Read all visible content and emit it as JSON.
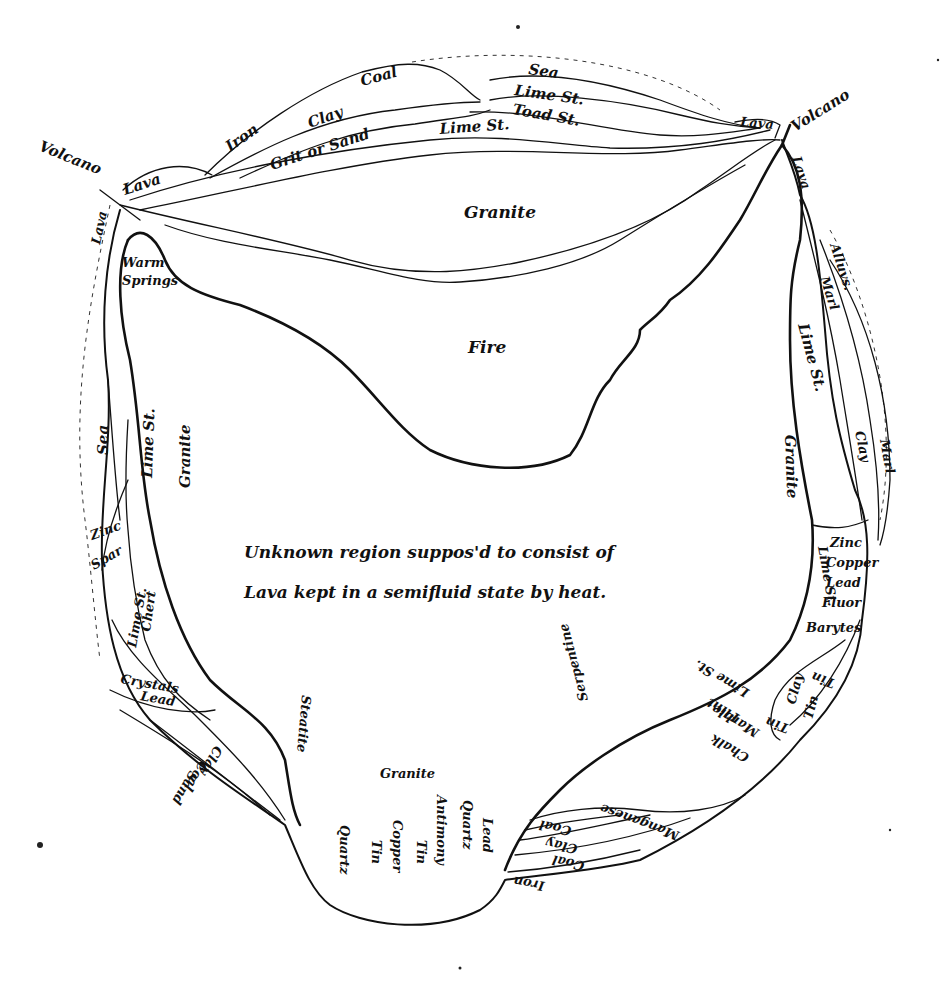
{
  "diagram": {
    "center_text": {
      "line1": "Unknown region suppos'd to consist of",
      "line2": "Lava kept in a semifluid state by heat."
    },
    "regions": {
      "upper_granite": "Granite",
      "fire": "Fire",
      "warm_springs_line1": "Warm",
      "warm_springs_line2": "Springs",
      "bottom_granite": "Granite"
    },
    "volcanoes": {
      "left": "Volcano",
      "right": "Volcano"
    },
    "top_strata": {
      "sea": "Sea",
      "lime_st_1": "Lime St.",
      "toad_st": "Toad St.",
      "lime_st_2": "Lime St.",
      "coal": "Coal",
      "clay": "Clay",
      "iron": "Iron",
      "grit_or_sand": "Grit or Sand",
      "lava_left": "Lava",
      "lava_right": "Lava"
    },
    "left_strata": {
      "lava": "Lava",
      "sea": "Sea",
      "lime_st": "Lime St.",
      "granite": "Granite",
      "zinc": "Zinc",
      "spar": "Spar",
      "lime_st_2": "Lime St.",
      "chert": "Chert",
      "crystals": "Crystals",
      "lead": "Lead",
      "clay": "Clay",
      "coal": "Coal",
      "sand": "Sand",
      "steatite": "Steatite"
    },
    "right_strata": {
      "lava": "Lava",
      "alluvium": "Alluvs.",
      "marl_inner": "Marl",
      "lime_st": "Lime St.",
      "clay": "Clay",
      "marl_outer": "Marl",
      "granite": "Granite",
      "lime_st_2": "Lime St.",
      "zinc": "Zinc",
      "copper": "Copper",
      "lead": "Lead",
      "fluor": "Fluor",
      "barytes": "Barytes",
      "tin_1": "Tin",
      "clay_2": "Clay",
      "tin_2": "Tin",
      "tin_3": "Tin"
    },
    "bottom_strata": {
      "lime_st": "Lime St.",
      "flint": "Flint",
      "marble": "Marble",
      "chalk": "Chalk",
      "serpentine": "Serpentine",
      "coal_small": "Coal",
      "clay": "Clay",
      "coal": "Coal",
      "manganese": "Manganese",
      "iron": "Iron"
    },
    "bottom_minerals": [
      "Lead",
      "Quartz",
      "Antimony",
      "Tin",
      "Copper",
      "Tin",
      "Quartz"
    ]
  }
}
